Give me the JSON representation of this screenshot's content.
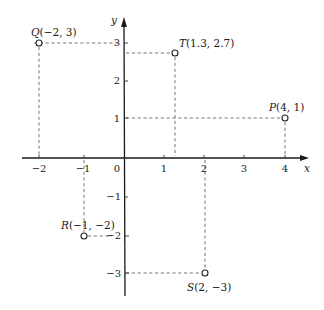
{
  "diagram": {
    "type": "cartesian-coordinate-plane",
    "axes": {
      "x_label": "x",
      "y_label": "y",
      "origin_label": "0",
      "x_ticks": [
        {
          "value": -2,
          "label": "−2"
        },
        {
          "value": -1,
          "label": "−1"
        },
        {
          "value": 1,
          "label": "1"
        },
        {
          "value": 2,
          "label": "2"
        },
        {
          "value": 3,
          "label": "3"
        },
        {
          "value": 4,
          "label": "4"
        }
      ],
      "y_ticks": [
        {
          "value": 3,
          "label": "3"
        },
        {
          "value": 2,
          "label": "2"
        },
        {
          "value": 1,
          "label": "1"
        },
        {
          "value": -1,
          "label": "−1"
        },
        {
          "value": -2,
          "label": "−2"
        },
        {
          "value": -3,
          "label": "−3"
        }
      ]
    },
    "points": [
      {
        "name": "Q",
        "x": -2,
        "y": 3,
        "coords": "(−2, 3)"
      },
      {
        "name": "T",
        "x": 1.3,
        "y": 2.7,
        "coords": "(1.3, 2.7)"
      },
      {
        "name": "P",
        "x": 4,
        "y": 1,
        "coords": "(4, 1)"
      },
      {
        "name": "R",
        "x": -1,
        "y": -2,
        "coords": "(−1, −2)"
      },
      {
        "name": "S",
        "x": 2,
        "y": -3,
        "coords": "(2, −3)"
      }
    ],
    "colors": {
      "axis": "#1a1a1a",
      "guide": "#555555",
      "background": "#ffffff"
    }
  }
}
